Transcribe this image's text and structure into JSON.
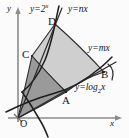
{
  "figure": {
    "axes": {
      "x_label": "x",
      "y_label": "y",
      "origin_label": "O"
    },
    "points": [
      {
        "name": "O",
        "label": "O",
        "x": 18,
        "y": 118
      },
      {
        "name": "A",
        "label": "A",
        "x": 66,
        "y": 92
      },
      {
        "name": "B",
        "label": "B",
        "x": 104,
        "y": 72
      },
      {
        "name": "C",
        "label": "C",
        "x": 32,
        "y": 56
      },
      {
        "name": "D",
        "label": "D",
        "x": 55,
        "y": 24
      }
    ],
    "curve_labels": [
      {
        "name": "exponential",
        "text": "y=2",
        "exponent": "x",
        "x": 30,
        "y": 6
      },
      {
        "name": "line-nx",
        "text": "y=nx",
        "x": 68,
        "y": 6
      },
      {
        "name": "line-mx",
        "text": "y=mx",
        "x": 90,
        "y": 45
      },
      {
        "name": "log",
        "text": "y=log",
        "base": "2",
        "arg": "x",
        "x": 76,
        "y": 84
      }
    ],
    "regions": [
      {
        "name": "outer-region",
        "vertices": "C-D-B-A",
        "shade": "#cfcfcf"
      },
      {
        "name": "inner-region",
        "vertices": "O-C-A",
        "shade": "#9a9a9a"
      }
    ],
    "colors": {
      "axis": "#8b8b8b",
      "curve": "#1d1d1d",
      "light_fill": "#cfcfcf",
      "dark_fill": "#9a9a9a",
      "background": "#fbfbfb"
    }
  }
}
